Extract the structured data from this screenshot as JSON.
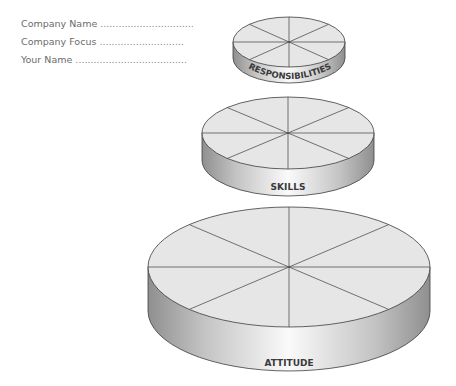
{
  "form": {
    "fields": [
      {
        "label": "Company Name",
        "dots": "..............................."
      },
      {
        "label": "Company Focus",
        "dots": "............................"
      },
      {
        "label": "Your Name",
        "dots": "....................................."
      }
    ]
  },
  "diagram": {
    "tiers": [
      {
        "label": "RESPONSIBILITIES",
        "segments": 8
      },
      {
        "label": "SKILLS",
        "segments": 8
      },
      {
        "label": "ATTITUDE",
        "segments": 8
      }
    ],
    "colors": {
      "top_fill": "#e6e6e6",
      "outline": "#3c3c3c",
      "side_dark": "#9a9a9a",
      "side_light": "#f4f4f4"
    }
  }
}
